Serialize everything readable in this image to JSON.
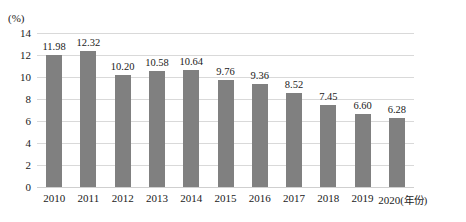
{
  "chart_data": {
    "type": "bar",
    "title": "",
    "subtitle": "",
    "xlabel": "年份",
    "ylabel": "(%)",
    "unit_label": "(%)",
    "categories": [
      "2010",
      "2011",
      "2012",
      "2013",
      "2014",
      "2015",
      "2016",
      "2017",
      "2018",
      "2019",
      "2020"
    ],
    "values": [
      11.98,
      12.32,
      10.2,
      10.58,
      10.64,
      9.76,
      9.36,
      8.52,
      7.45,
      6.6,
      6.28
    ],
    "value_labels": [
      "11.98",
      "12.32",
      "10.20",
      "10.58",
      "10.64",
      "9.76",
      "9.36",
      "8.52",
      "7.45",
      "6.60",
      "6.28"
    ],
    "ylim": [
      0,
      14
    ],
    "yticks": [
      0,
      2,
      4,
      6,
      8,
      10,
      12,
      14
    ],
    "ytick_labels": [
      "0",
      "2",
      "4",
      "6",
      "8",
      "10",
      "12",
      "14"
    ],
    "grid": true,
    "grid_axis": "y",
    "legend": false,
    "legend_position": "none",
    "bar_color": "#808080",
    "grid_color": "#d9d9d9",
    "text_color": "#1a1a1a",
    "background_color": "#ffffff",
    "last_category_axis_suffix": "(年份)"
  }
}
